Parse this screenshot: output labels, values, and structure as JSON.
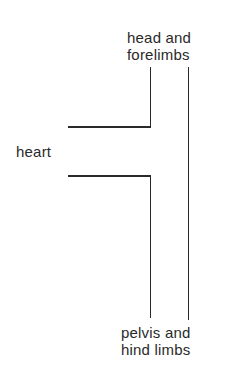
{
  "diagram": {
    "labels": {
      "head": [
        "head and",
        "forelimbs"
      ],
      "heart": "heart",
      "pelvis": [
        "pelvis and",
        "hind limbs"
      ]
    },
    "colors": {
      "line": "#2a2a2a",
      "text": "#2a2a2a",
      "background": "#ffffff"
    }
  }
}
